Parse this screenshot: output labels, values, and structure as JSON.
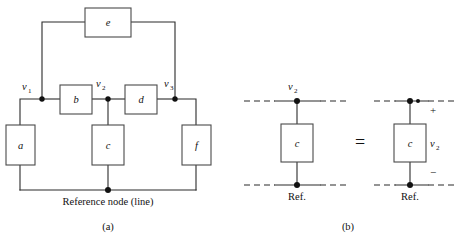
{
  "figure": {
    "title_parts": [
      "(a)",
      "(b)"
    ],
    "panel_a": {
      "caption": "(a)",
      "reference_label": "Reference node (line)",
      "node_labels": [
        {
          "name": "v1",
          "base": "v",
          "sub": "1"
        },
        {
          "name": "v2",
          "base": "v",
          "sub": "2"
        },
        {
          "name": "v3",
          "base": "v",
          "sub": "3"
        }
      ],
      "elements": [
        {
          "name": "element-e",
          "label": "e"
        },
        {
          "name": "element-b",
          "label": "b"
        },
        {
          "name": "element-d",
          "label": "d"
        },
        {
          "name": "element-a",
          "label": "a"
        },
        {
          "name": "element-c",
          "label": "c"
        },
        {
          "name": "element-f",
          "label": "f"
        }
      ]
    },
    "panel_b": {
      "caption": "(b)",
      "equals_sign": "=",
      "left": {
        "top_node_label": {
          "base": "v",
          "sub": "2"
        },
        "element_label": "c",
        "ref_label": "Ref."
      },
      "right": {
        "plus_sign": "+",
        "minus_sign": "−",
        "voltage_label": {
          "base": "v",
          "sub": "2"
        },
        "element_label": "c",
        "ref_label": "Ref."
      }
    }
  },
  "colors": {
    "wire": "#2b2b2b",
    "box_stroke": "#4a4a4a",
    "node_fill": "#111111",
    "background": "#ffffff",
    "text": "#111111"
  }
}
